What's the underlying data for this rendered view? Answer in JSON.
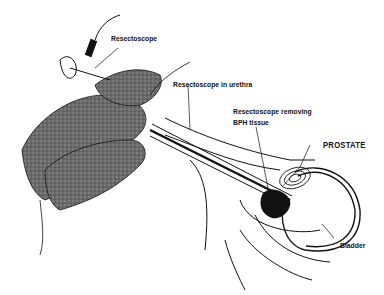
{
  "diagram": {
    "labels": {
      "resectoscope": "Resectoscope",
      "resectoscope_in_urethra": "Resectoscope in urethra",
      "resectoscope_removing_line1": "Resectoscope removing",
      "resectoscope_removing_line2": "BPH tissue",
      "prostate": "PROSTATE",
      "bladder": "Bladder"
    },
    "colors": {
      "ink": "#111111",
      "hand_fill": "#5a5a5a",
      "background": "#ffffff"
    }
  }
}
